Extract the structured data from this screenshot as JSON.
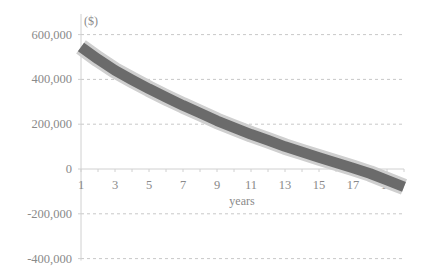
{
  "chart_data": {
    "type": "line",
    "title": "",
    "xlabel": "years",
    "ylabel": "($)",
    "x": [
      1,
      2,
      3,
      4,
      5,
      6,
      7,
      8,
      9,
      10,
      11,
      12,
      13,
      14,
      15,
      16,
      17,
      18,
      19,
      20
    ],
    "x_tick_labels": [
      "1",
      "3",
      "5",
      "7",
      "9",
      "11",
      "13",
      "15",
      "17",
      "19"
    ],
    "y_tick_labels": [
      "600,000",
      "400,000",
      "200,000",
      "0",
      "-200,000",
      "-400,000"
    ],
    "y_ticks": [
      600000,
      400000,
      200000,
      0,
      -200000,
      -400000
    ],
    "ylim": [
      -400000,
      650000
    ],
    "xlim": [
      1,
      20
    ],
    "grid": {
      "horizontal": true,
      "style": "dashed"
    },
    "legend": null,
    "series": [
      {
        "name": "value",
        "values": [
          545000,
          490000,
          440000,
          398000,
          358000,
          320000,
          284000,
          250000,
          215000,
          185000,
          155000,
          128000,
          100000,
          76000,
          52000,
          28000,
          5000,
          -20000,
          -50000,
          -80000
        ],
        "band_half_width": 28000
      }
    ]
  },
  "colors": {
    "line": "#6b6b6b",
    "band": "#cfcfcf",
    "axis": "#d0d0d0",
    "grid": "#c8c8c8",
    "text": "#8a8a8a"
  }
}
